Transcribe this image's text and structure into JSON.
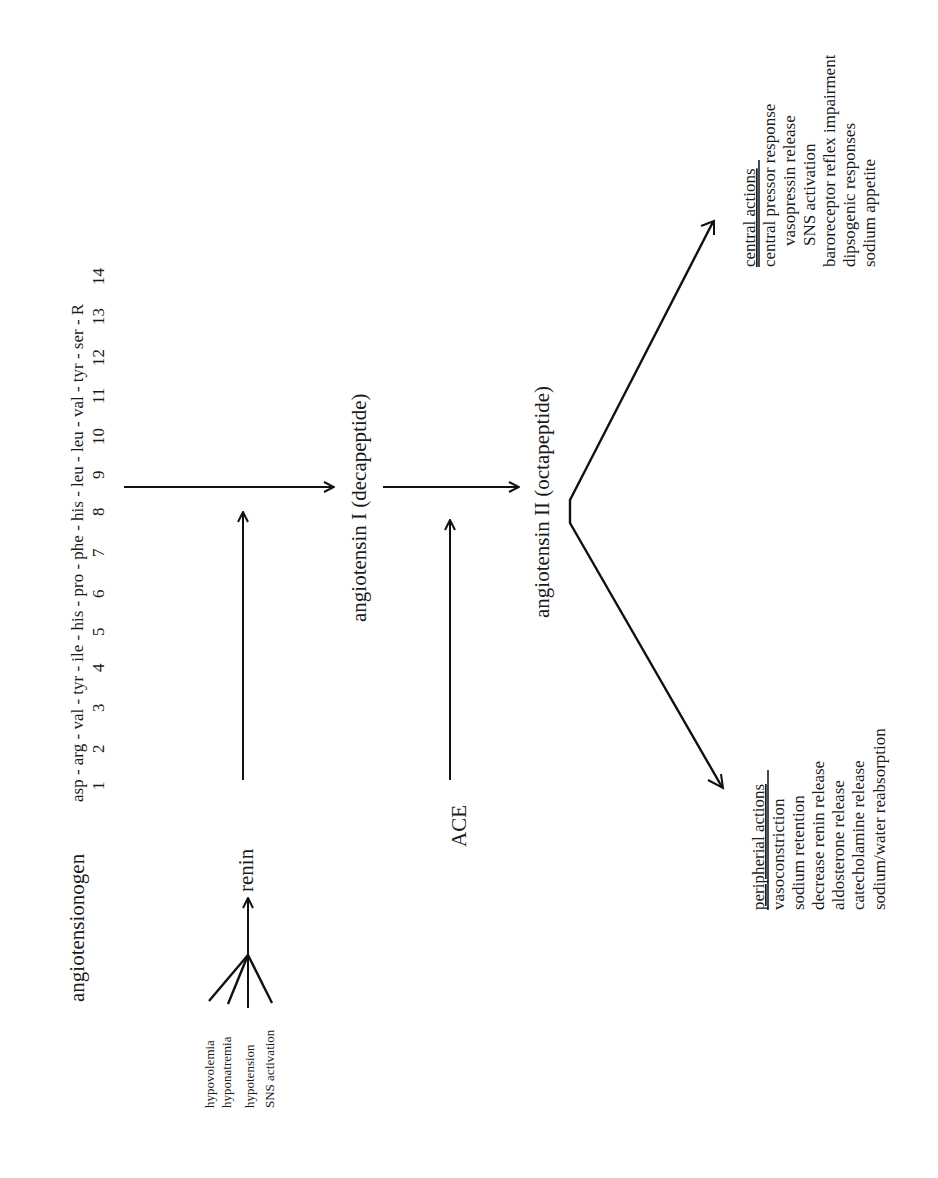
{
  "diagram": {
    "orientation": "rotated-90-ccw",
    "nodes": {
      "angiotensinogen": "angiotensionogen",
      "peptide_residues": "asp - arg - val - tyr - ile - his - pro - phe - his - leu - leu - val - tyr - ser - R",
      "peptide_positions": "1      2      3      4      5     6      7      8      9     10     11     12     13     14",
      "renin": "renin",
      "ace": "ACE",
      "angiotensin_1": "angiotensin I (decapeptide)",
      "angiotensin_2": "angiotensin II (octapeptide)"
    },
    "renin_stimuli": [
      "hypovolemia",
      "hyponatremia",
      "hypotension",
      "SNS activation"
    ],
    "central_actions": {
      "title": "central actions",
      "items": [
        "central pressor response",
        "vasopressin release",
        "SNS activation",
        "baroreceptor reflex impairment",
        "dipsogenic responses",
        "sodium appetite"
      ]
    },
    "peripheral_actions": {
      "title": "peripherial actions",
      "items": [
        "vasoconstriction",
        "sodium retention",
        "decrease renin release",
        "aldosterone release",
        "catecholamine release",
        "sodium/water reabsorption"
      ]
    },
    "colors": {
      "ink": "#1a1a1a",
      "background": "#ffffff"
    }
  }
}
